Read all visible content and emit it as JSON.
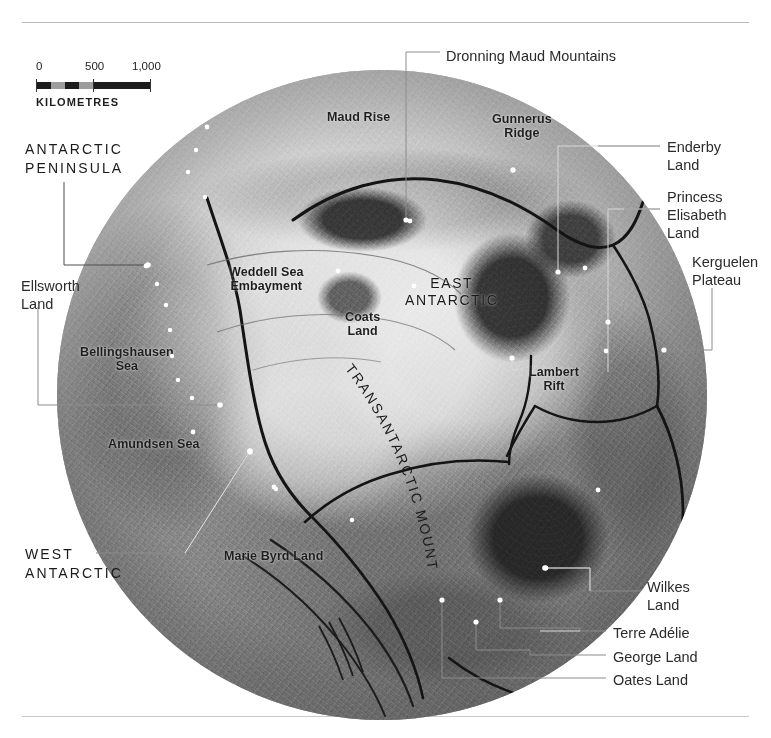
{
  "figure": {
    "top_rule": true,
    "bottom_rule": true
  },
  "scale": {
    "tick_0": "0",
    "tick_500": "500",
    "tick_1000": "1,000",
    "units_label": "KILOMETRES"
  },
  "map": {
    "projection_note": "polar-circular",
    "interior_labels": [
      {
        "id": "maud-rise",
        "text": "Maud Rise",
        "x": 327,
        "y": 110,
        "style": "title"
      },
      {
        "id": "gunnerus-ridge",
        "text": "Gunnerus\nRidge",
        "x": 492,
        "y": 112,
        "style": "title"
      },
      {
        "id": "weddell-sea",
        "text": "Weddell Sea\nEmbayment",
        "x": 229,
        "y": 265,
        "style": "title"
      },
      {
        "id": "coats-land",
        "text": "Coats\nLand",
        "x": 345,
        "y": 310,
        "style": "title"
      },
      {
        "id": "east-antarctic",
        "text": "EAST\nANTARCTIC",
        "x": 405,
        "y": 275,
        "style": "caps"
      },
      {
        "id": "lambert-rift",
        "text": "Lambert\nRift",
        "x": 529,
        "y": 365,
        "style": "title"
      },
      {
        "id": "bellingshausen",
        "text": "Bellingshausen\nSea",
        "x": 80,
        "y": 345,
        "style": "title"
      },
      {
        "id": "amundsen-sea",
        "text": "Amundsen Sea",
        "x": 108,
        "y": 437,
        "style": "title"
      },
      {
        "id": "marie-byrd-land",
        "text": "Marie Byrd Land",
        "x": 224,
        "y": 549,
        "style": "title"
      }
    ],
    "curved_label": {
      "id": "transantarctic-mountains",
      "text": "TRANSANTARCTIC MOUNTAINS"
    },
    "outer_labels": [
      {
        "id": "dronning-maud-mountains",
        "text": "Dronning Maud Mountains",
        "x": 446,
        "y": 47,
        "align": "left"
      },
      {
        "id": "enderby-land",
        "text": "Enderby\nLand",
        "x": 667,
        "y": 138,
        "align": "left"
      },
      {
        "id": "princess-elisabeth-land",
        "text": "Princess\nElisabeth\nLand",
        "x": 667,
        "y": 188,
        "align": "left"
      },
      {
        "id": "kerguelen-plateau",
        "text": "Kerguelen\nPlateau",
        "x": 692,
        "y": 253,
        "align": "left"
      },
      {
        "id": "antarctic-peninsula",
        "text": "ANTARCTIC\nPENINSULA",
        "x": 25,
        "y": 140,
        "align": "left",
        "style": "caps"
      },
      {
        "id": "ellsworth-land",
        "text": "Ellsworth\nLand",
        "x": 21,
        "y": 277,
        "align": "left"
      },
      {
        "id": "west-antarctic",
        "text": "WEST\nANTARCTIC",
        "x": 25,
        "y": 545,
        "align": "left",
        "style": "caps"
      },
      {
        "id": "wilkes-land",
        "text": "Wilkes\nLand",
        "x": 647,
        "y": 578,
        "align": "left"
      },
      {
        "id": "terre-adelie",
        "text": "Terre Adélie",
        "x": 613,
        "y": 624,
        "align": "left"
      },
      {
        "id": "george-land",
        "text": "George Land",
        "x": 613,
        "y": 648,
        "align": "left"
      },
      {
        "id": "oates-land",
        "text": "Oates Land",
        "x": 613,
        "y": 671,
        "align": "left"
      }
    ]
  },
  "colors": {
    "ink": "#1e1e1e",
    "rule": "#b9b9b9",
    "leader": "#7a7a7a",
    "leader_light": "#e8e8e8",
    "marker": "#ffffff",
    "map_mid": "#a9a9a9"
  }
}
